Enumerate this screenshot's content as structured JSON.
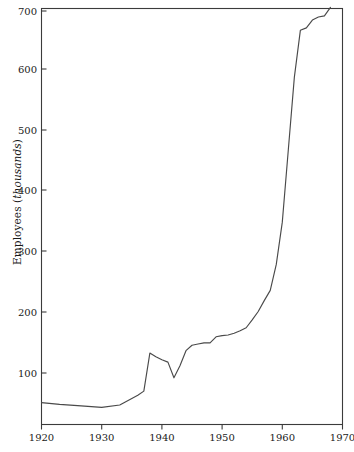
{
  "chart_data": {
    "type": "line",
    "title": "",
    "xlabel": "",
    "ylabel": "Employees (thousands)",
    "ylabel_plain": "Employees (",
    "ylabel_unit": "thousands",
    "ylabel_close": ")",
    "xlim": [
      1920,
      1970
    ],
    "ylim": [
      47,
      715
    ],
    "grid": false,
    "legend": "none",
    "xticks": [
      1920,
      1930,
      1940,
      1950,
      1960,
      1970
    ],
    "xticklabels": [
      "1920",
      "1930",
      "1940",
      "1950",
      "1960",
      "1970"
    ],
    "yticks": [
      100,
      200,
      300,
      400,
      500,
      600,
      700
    ],
    "yticklabels": [
      "100",
      "200",
      "300",
      "400",
      "500",
      "600",
      "700"
    ],
    "series": [
      {
        "name": "Employees",
        "color": "#4a4a4a",
        "x": [
          1920,
          1923,
          1926,
          1930,
          1933,
          1936,
          1937,
          1938,
          1939,
          1940,
          1941,
          1942,
          1943,
          1944,
          1945,
          1946,
          1947,
          1948,
          1949,
          1950,
          1951,
          1952,
          1953,
          1954,
          1955,
          1956,
          1957,
          1958,
          1959,
          1960,
          1961,
          1962,
          1963,
          1964,
          1965,
          1966,
          1967,
          1968
        ],
        "y": [
          51,
          48,
          46,
          43,
          47,
          63,
          70,
          133,
          127,
          122,
          118,
          92,
          112,
          137,
          146,
          148,
          150,
          150,
          160,
          162,
          163,
          166,
          170,
          175,
          188,
          202,
          220,
          237,
          280,
          350,
          470,
          590,
          668,
          672,
          685,
          690,
          692,
          706
        ]
      }
    ],
    "axis_style": {
      "frame": "box",
      "x_tick_direction": "out",
      "y_tick_direction": "in",
      "stroke_color": "#3b3b3b"
    }
  },
  "figure": {
    "background": "#ffffff"
  }
}
